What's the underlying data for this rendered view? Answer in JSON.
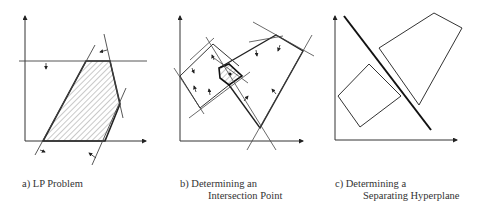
{
  "panels": [
    {
      "id": "a",
      "caption_line1": "a) LP Problem",
      "caption_line2": ""
    },
    {
      "id": "b",
      "caption_line1": "b) Determining an",
      "caption_line2": "Intersection Point"
    },
    {
      "id": "c",
      "caption_line1": "c) Determining a",
      "caption_line2": "Separating Hyperplane"
    }
  ],
  "colors": {
    "line": "#222222",
    "thin_line": "#444444",
    "hatch": "#777777",
    "background": "#ffffff"
  }
}
